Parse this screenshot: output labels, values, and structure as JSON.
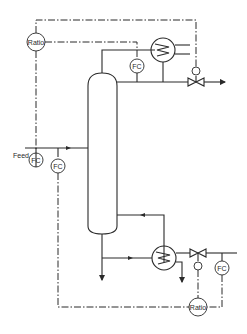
{
  "diagram": {
    "type": "process-flow-diagram",
    "labels": {
      "feed": "Feed",
      "ratio_top": "Ratio",
      "ratio_bottom": "Ratio",
      "fc_top": "FC",
      "fc_feed_upper": "FC",
      "fc_feed_lower": "FC",
      "fc_bottom": "FC"
    },
    "colors": {
      "line": "#2a2a2a",
      "background": "#ffffff"
    }
  }
}
